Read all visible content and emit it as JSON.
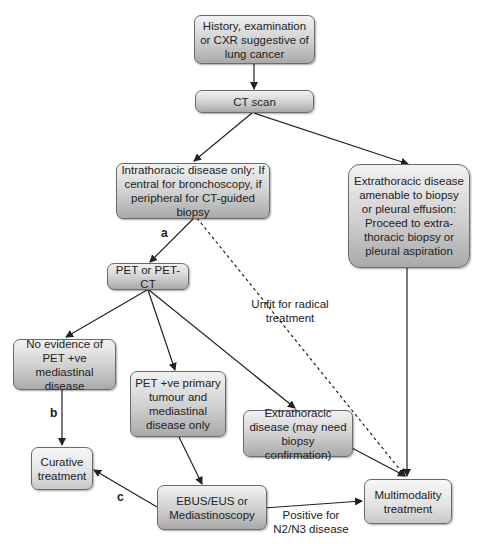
{
  "nodes": {
    "history": "History, examination or CXR suggestive of lung cancer",
    "ct_scan": "CT scan",
    "intrathoracic": "Intrathoracic disease only: If central for bronchoscopy, if peripheral for CT-guided biopsy",
    "extrathoracic_biopsy": "Extrathoracic disease amenable to biopsy or pleural effusion: Proceed to extra-thoracic biopsy or pleural aspiration",
    "pet": "PET or PET-CT",
    "no_evidence": "No evidence of PET +ve mediastinal disease",
    "pet_positive": "PET +ve primary tumour and mediastinal disease only",
    "extrathoracic_confirm": "Extrathoracic disease (may need biopsy confirmation)",
    "curative": "Curative treatment",
    "ebus": "EBUS/EUS or Mediastinoscopy",
    "multimodality": "Multimodality treatment"
  },
  "edge_labels": {
    "a": "a",
    "b": "b",
    "c": "c",
    "unfit": "Unfit for radical treatment",
    "positive_n2n3": "Positive for N2/N3 disease"
  },
  "colors": {
    "box_border": "#6b6b6b",
    "box_gradient_top": "#f2f2f2",
    "box_gradient_bottom": "#a9a9a9",
    "line": "#222222"
  }
}
